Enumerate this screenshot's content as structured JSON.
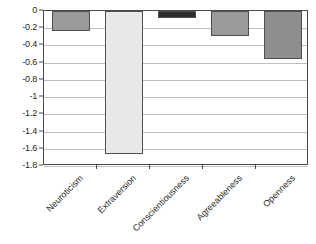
{
  "chart_data": {
    "type": "bar",
    "title": "",
    "subtitle": "",
    "xlabel": "",
    "ylabel": "",
    "categories": [
      "Neuroticism",
      "Extraversion",
      "Conscientiousness",
      "Agreeableness",
      "Openness"
    ],
    "values": [
      -0.23,
      -1.66,
      -0.08,
      -0.29,
      -0.56
    ],
    "ylim": [
      -1.8,
      0
    ],
    "ytick_labels": [
      "0",
      "-0.2",
      "-0.4",
      "-0.6",
      "-0.8",
      "-1",
      "-1.2",
      "-1.4",
      "-1.6",
      "-1.8"
    ],
    "ytick_values": [
      0,
      -0.2,
      -0.4,
      -0.6,
      -0.8,
      -1,
      -1.2,
      -1.4,
      -1.6,
      -1.8
    ],
    "grid": true,
    "legend": "none",
    "orientation": "vertical",
    "bar_colors": [
      "#9a9a9a",
      "#e8e8e8",
      "#2e2e2e",
      "#9a9a9a",
      "#8e8e8e"
    ],
    "bar_edge_color": "#4f4f4f",
    "axis_color": "#4a4a4a",
    "grid_color": "#bdbdbd",
    "background": "#ffffff"
  }
}
